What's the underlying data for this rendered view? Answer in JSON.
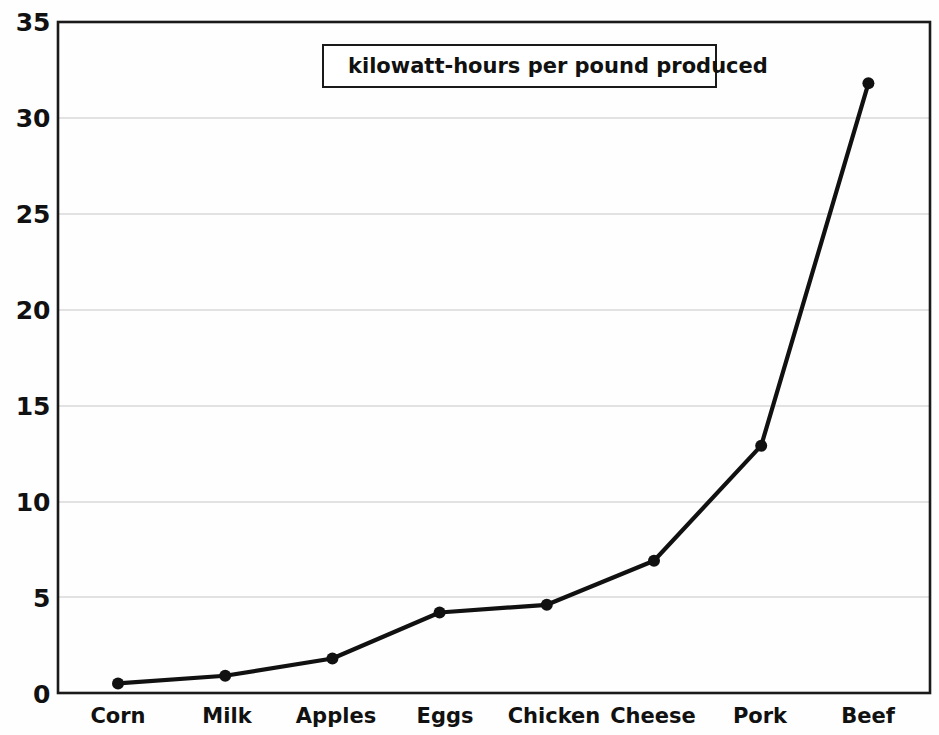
{
  "chart_data": {
    "type": "line",
    "title": "",
    "subtitle": "",
    "xlabel": "",
    "ylabel": "",
    "categories": [
      "Corn",
      "Milk",
      "Apples",
      "Eggs",
      "Chicken",
      "Cheese",
      "Pork",
      "Beef"
    ],
    "series": [
      {
        "name": "kilowatt-hours per pound produced",
        "values": [
          0.5,
          0.9,
          1.8,
          4.2,
          4.6,
          6.9,
          12.9,
          31.8
        ],
        "color": "#111111",
        "marker": "circle"
      }
    ],
    "ylim": [
      0,
      35
    ],
    "yticks": [
      0,
      5,
      10,
      15,
      20,
      25,
      30,
      35
    ],
    "ytick_labels": [
      "0",
      "5",
      "10",
      "15",
      "20",
      "25",
      "30",
      "35"
    ],
    "grid": true,
    "grid_axis": "y",
    "grid_color": "#d9d9d9",
    "legend": {
      "position": "top-center",
      "entries": [
        "kilowatt-hours per pound produced"
      ],
      "symbol": "line-with-marker"
    },
    "plot_border_color": "#1a1a1a",
    "background": "#ffffff"
  },
  "axes": {
    "y_ticks": [
      "35",
      "30",
      "25",
      "20",
      "15",
      "10",
      "5",
      "0"
    ],
    "x_categories": [
      "Corn",
      "Milk",
      "Apples",
      "Eggs",
      "Chicken",
      "Cheese",
      "Pork",
      "Beef"
    ]
  },
  "legend": {
    "label": "kilowatt-hours per pound produced"
  }
}
